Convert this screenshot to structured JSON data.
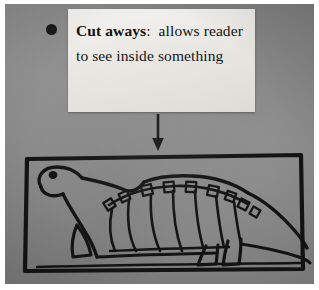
{
  "photo": {
    "kind": "photograph-of-poster",
    "background_color": "#ffffff",
    "board_color": "#8b8b8b"
  },
  "note": {
    "bullet_icon": "bullet-dot-icon",
    "paper_color": "#e9e7e2",
    "term": "Cut aways",
    "separator": ":",
    "definition": "allows reader to see inside something",
    "full_text": "Cut aways: allows reader to see inside something",
    "lines": [
      "Cut aways:  allows",
      "reader to see inside",
      "something"
    ]
  },
  "arrow": {
    "icon": "arrow-down-icon",
    "direction": "down",
    "color": "#141414",
    "meaning": "points from the definition to the example drawing"
  },
  "drawing": {
    "icon": "dinosaur-cutaway-illustration",
    "title": "Cutaway drawing of a dinosaur",
    "description": "Hand-drawn side view of a long-necked dinosaur with the body drawn as a cutaway revealing the spine and ribcage inside",
    "frame_color": "#141414",
    "ink_color": "#141414",
    "parts": [
      "frame-border",
      "head",
      "eye",
      "neck",
      "back",
      "spine-vertebrae",
      "ribs",
      "belly-line",
      "front-leg",
      "hind-legs",
      "tail"
    ],
    "vertebrae_count": 9,
    "rib_count": 7
  }
}
